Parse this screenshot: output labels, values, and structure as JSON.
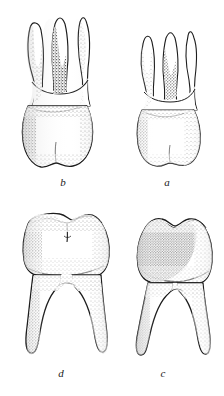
{
  "plate": {
    "title": "Comparative plate of human molar teeth",
    "description": "Pen-and-ink stipple drawings of four molar teeth arranged in two rows of two.",
    "background_color": "#ffffff",
    "ink_color": "#1a1a1a",
    "width": 224,
    "height": 396
  },
  "figures": [
    {
      "id": "b",
      "label": "b",
      "position": "top-left",
      "subject": "upper molar",
      "roots": 3,
      "view": "buccal",
      "relative_size": "large",
      "shading": "stipple"
    },
    {
      "id": "a",
      "label": "a",
      "position": "top-right",
      "subject": "upper molar",
      "roots": 3,
      "view": "buccal",
      "relative_size": "small",
      "shading": "stipple"
    },
    {
      "id": "d",
      "label": "d",
      "position": "bottom-left",
      "subject": "lower molar",
      "roots": 2,
      "view": "buccal",
      "relative_size": "large",
      "shading": "stipple"
    },
    {
      "id": "c",
      "label": "c",
      "position": "bottom-right",
      "subject": "lower molar",
      "roots": 2,
      "view": "buccal",
      "relative_size": "small",
      "shading": "stipple"
    }
  ]
}
